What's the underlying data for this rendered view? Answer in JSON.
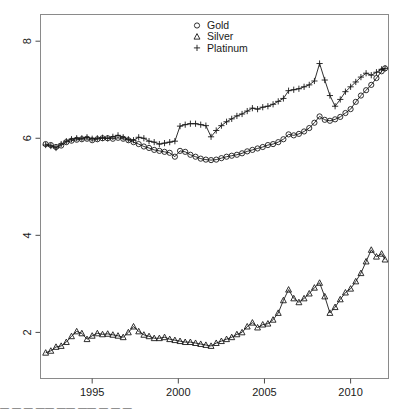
{
  "chart_data": {
    "type": "line",
    "title": "",
    "xlabel": "",
    "ylabel": "",
    "xlim": [
      1992.0,
      2012.2
    ],
    "ylim": [
      1.05,
      8.55
    ],
    "xticks": [
      1995,
      2000,
      2005,
      2010
    ],
    "xtick_labels": [
      "1995",
      "2000",
      "2005",
      "2010"
    ],
    "yticks": [
      2,
      4,
      6,
      8
    ],
    "ytick_labels": [
      "2",
      "4",
      "6",
      "8"
    ],
    "grid": false,
    "box": true,
    "legend_position": "top-center",
    "legend": [
      {
        "name": "Gold",
        "marker": "circle-icon"
      },
      {
        "name": "Silver",
        "marker": "triangle-icon"
      },
      {
        "name": "Platinum",
        "marker": "plus-icon"
      }
    ],
    "series": [
      {
        "name": "Gold",
        "marker": "circle-icon",
        "color": "#1a1a1a",
        "x": [
          1992.3,
          1992.6,
          1992.9,
          1993.2,
          1993.5,
          1993.8,
          1994.1,
          1994.4,
          1994.7,
          1995.0,
          1995.3,
          1995.6,
          1995.9,
          1996.2,
          1996.5,
          1996.8,
          1997.1,
          1997.4,
          1997.7,
          1998.0,
          1998.3,
          1998.6,
          1998.9,
          1999.2,
          1999.5,
          1999.8,
          2000.1,
          2000.4,
          2000.7,
          2001.0,
          2001.3,
          2001.6,
          2001.9,
          2002.2,
          2002.5,
          2002.8,
          2003.1,
          2003.4,
          2003.7,
          2004.0,
          2004.3,
          2004.6,
          2004.9,
          2005.2,
          2005.5,
          2005.8,
          2006.1,
          2006.4,
          2006.7,
          2007.0,
          2007.3,
          2007.6,
          2007.9,
          2008.2,
          2008.5,
          2008.8,
          2009.1,
          2009.4,
          2009.7,
          2010.0,
          2010.3,
          2010.6,
          2010.9,
          2011.2,
          2011.5,
          2011.8,
          2012.0
        ],
        "y": [
          5.88,
          5.86,
          5.82,
          5.85,
          5.92,
          5.95,
          5.97,
          5.98,
          5.99,
          5.96,
          5.98,
          6.0,
          6.0,
          5.99,
          6.01,
          5.99,
          5.96,
          5.92,
          5.88,
          5.83,
          5.8,
          5.76,
          5.74,
          5.72,
          5.7,
          5.62,
          5.74,
          5.72,
          5.66,
          5.62,
          5.58,
          5.56,
          5.55,
          5.56,
          5.59,
          5.62,
          5.64,
          5.66,
          5.69,
          5.73,
          5.76,
          5.79,
          5.82,
          5.86,
          5.88,
          5.92,
          5.98,
          6.08,
          6.06,
          6.09,
          6.14,
          6.21,
          6.32,
          6.45,
          6.38,
          6.36,
          6.39,
          6.44,
          6.52,
          6.6,
          6.75,
          6.88,
          6.99,
          7.1,
          7.24,
          7.38,
          7.44
        ]
      },
      {
        "name": "Silver",
        "marker": "triangle-icon",
        "color": "#1a1a1a",
        "x": [
          1992.3,
          1992.6,
          1992.9,
          1993.2,
          1993.5,
          1993.8,
          1994.1,
          1994.4,
          1994.7,
          1995.0,
          1995.3,
          1995.6,
          1995.9,
          1996.2,
          1996.5,
          1996.8,
          1997.1,
          1997.4,
          1997.7,
          1998.0,
          1998.3,
          1998.6,
          1998.9,
          1999.2,
          1999.5,
          1999.8,
          2000.1,
          2000.4,
          2000.7,
          2001.0,
          2001.3,
          2001.6,
          2001.9,
          2002.2,
          2002.5,
          2002.8,
          2003.1,
          2003.4,
          2003.7,
          2004.0,
          2004.3,
          2004.6,
          2004.9,
          2005.2,
          2005.5,
          2005.8,
          2006.1,
          2006.4,
          2006.7,
          2007.0,
          2007.3,
          2007.6,
          2007.9,
          2008.2,
          2008.5,
          2008.8,
          2009.1,
          2009.4,
          2009.7,
          2010.0,
          2010.3,
          2010.6,
          2010.9,
          2011.2,
          2011.5,
          2011.8,
          2012.0
        ],
        "y": [
          1.58,
          1.62,
          1.7,
          1.72,
          1.8,
          1.92,
          2.02,
          1.98,
          1.86,
          1.93,
          1.98,
          1.96,
          1.97,
          1.95,
          1.93,
          1.9,
          2.0,
          2.12,
          2.02,
          1.95,
          1.92,
          1.88,
          1.88,
          1.9,
          1.86,
          1.84,
          1.82,
          1.8,
          1.8,
          1.78,
          1.76,
          1.74,
          1.72,
          1.78,
          1.82,
          1.86,
          1.9,
          1.96,
          2.0,
          2.12,
          2.2,
          2.1,
          2.16,
          2.18,
          2.26,
          2.4,
          2.66,
          2.88,
          2.7,
          2.62,
          2.7,
          2.8,
          2.92,
          3.02,
          2.74,
          2.4,
          2.52,
          2.68,
          2.82,
          2.9,
          3.05,
          3.22,
          3.46,
          3.7,
          3.56,
          3.62,
          3.5
        ]
      },
      {
        "name": "Platinum",
        "marker": "plus-icon",
        "color": "#1a1a1a",
        "x": [
          1992.3,
          1992.6,
          1992.9,
          1993.2,
          1993.5,
          1993.8,
          1994.1,
          1994.4,
          1994.7,
          1995.0,
          1995.3,
          1995.6,
          1995.9,
          1996.2,
          1996.5,
          1996.8,
          1997.1,
          1997.4,
          1997.7,
          1998.0,
          1998.3,
          1998.6,
          1998.9,
          1999.2,
          1999.5,
          1999.8,
          2000.1,
          2000.4,
          2000.7,
          2001.0,
          2001.3,
          2001.6,
          2001.9,
          2002.2,
          2002.5,
          2002.8,
          2003.1,
          2003.4,
          2003.7,
          2004.0,
          2004.3,
          2004.6,
          2004.9,
          2005.2,
          2005.5,
          2005.8,
          2006.1,
          2006.4,
          2006.7,
          2007.0,
          2007.3,
          2007.6,
          2007.9,
          2008.2,
          2008.5,
          2008.8,
          2009.1,
          2009.4,
          2009.7,
          2010.0,
          2010.3,
          2010.6,
          2010.9,
          2011.2,
          2011.5,
          2011.8,
          2012.0
        ],
        "y": [
          5.86,
          5.84,
          5.8,
          5.88,
          5.94,
          5.98,
          6.0,
          6.0,
          6.02,
          5.99,
          6.0,
          6.01,
          6.0,
          6.03,
          6.06,
          6.02,
          5.98,
          5.96,
          6.02,
          6.0,
          5.94,
          5.92,
          5.88,
          5.9,
          5.92,
          5.94,
          6.25,
          6.28,
          6.3,
          6.3,
          6.28,
          6.26,
          6.03,
          6.16,
          6.26,
          6.34,
          6.4,
          6.46,
          6.5,
          6.56,
          6.62,
          6.6,
          6.64,
          6.66,
          6.7,
          6.76,
          6.82,
          6.98,
          7.0,
          7.02,
          7.06,
          7.1,
          7.18,
          7.54,
          7.2,
          6.88,
          6.66,
          6.8,
          6.96,
          7.06,
          7.16,
          7.26,
          7.34,
          7.3,
          7.36,
          7.42,
          7.44
        ]
      }
    ]
  },
  "bottom_fragment": "— — —  ——  ——  —— —  —  —"
}
